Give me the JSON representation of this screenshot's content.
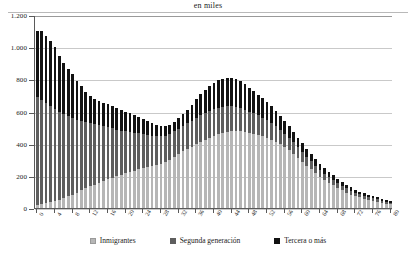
{
  "chart": {
    "title": "en miles",
    "legend": [
      {
        "key": "inmigrantes",
        "label": "Inmigrantes",
        "color": "#b6b6b6"
      },
      {
        "key": "segunda",
        "label": "Segunda generación",
        "color": "#5e5e5e"
      },
      {
        "key": "tercera",
        "label": "Tercera o más",
        "color": "#121212"
      }
    ]
  },
  "chart_data": {
    "type": "bar",
    "stacked": true,
    "title": "en miles",
    "xlabel": "",
    "ylabel": "",
    "ylim": [
      0,
      1200
    ],
    "yticks": [
      0,
      200,
      400,
      600,
      800,
      1000,
      1200
    ],
    "ytick_labels": [
      "0",
      "200",
      "400",
      "600",
      "800",
      "1.000",
      "1.200"
    ],
    "grid": true,
    "legend_position": "bottom",
    "xtick_step": 4,
    "categories": [
      "0",
      "1",
      "2",
      "3",
      "4",
      "5",
      "6",
      "7",
      "8",
      "9",
      "10",
      "11",
      "12",
      "13",
      "14",
      "15",
      "16",
      "17",
      "18",
      "19",
      "20",
      "21",
      "22",
      "23",
      "24",
      "25",
      "26",
      "27",
      "28",
      "29",
      "30",
      "31",
      "32",
      "33",
      "34",
      "35",
      "36",
      "37",
      "38",
      "39",
      "40",
      "41",
      "42",
      "43",
      "44",
      "45",
      "46",
      "47",
      "48",
      "49",
      "50",
      "51",
      "52",
      "53",
      "54",
      "55",
      "56",
      "57",
      "58",
      "59",
      "60",
      "61",
      "62",
      "63",
      "64",
      "65",
      "66",
      "67",
      "68",
      "69",
      "70",
      "71",
      "72",
      "73",
      "74",
      "75",
      "76",
      "77",
      "78",
      "79",
      "80"
    ],
    "xtick_labels": [
      "0",
      "4",
      "8",
      "12",
      "16",
      "20",
      "24",
      "28",
      "32",
      "36",
      "40",
      "44",
      "48",
      "52",
      "56",
      "60",
      "64",
      "68",
      "72",
      "76",
      "80"
    ],
    "series": [
      {
        "name": "Inmigrantes",
        "color": "#b6b6b6",
        "values": [
          18,
          24,
          30,
          36,
          44,
          52,
          62,
          72,
          84,
          96,
          110,
          122,
          134,
          146,
          158,
          168,
          178,
          188,
          196,
          206,
          216,
          224,
          232,
          240,
          248,
          256,
          262,
          268,
          276,
          286,
          300,
          318,
          336,
          352,
          366,
          380,
          396,
          410,
          424,
          436,
          448,
          458,
          466,
          472,
          478,
          480,
          478,
          474,
          468,
          462,
          456,
          448,
          438,
          426,
          412,
          396,
          378,
          358,
          336,
          312,
          288,
          264,
          240,
          216,
          194,
          174,
          156,
          140,
          124,
          110,
          96,
          84,
          74,
          66,
          58,
          52,
          46,
          40,
          34,
          28,
          24
        ]
      },
      {
        "name": "Segunda generación",
        "color": "#5e5e5e",
        "values": [
          672,
          648,
          624,
          600,
          572,
          548,
          524,
          500,
          476,
          452,
          430,
          410,
          392,
          374,
          356,
          340,
          324,
          308,
          292,
          276,
          262,
          248,
          236,
          224,
          212,
          200,
          188,
          178,
          170,
          164,
          160,
          158,
          158,
          158,
          160,
          162,
          164,
          166,
          168,
          168,
          168,
          166,
          164,
          160,
          156,
          150,
          144,
          138,
          132,
          126,
          120,
          114,
          108,
          102,
          96,
          90,
          84,
          78,
          72,
          66,
          60,
          56,
          52,
          48,
          44,
          40,
          37,
          34,
          31,
          28,
          26,
          24,
          22,
          20,
          18,
          16,
          15,
          14,
          12,
          11,
          10
        ]
      },
      {
        "name": "Tercera o más",
        "color": "#121212",
        "values": [
          410,
          428,
          416,
          404,
          386,
          348,
          316,
          290,
          272,
          244,
          218,
          190,
          168,
          158,
          150,
          146,
          144,
          140,
          136,
          130,
          122,
          116,
          110,
          104,
          96,
          88,
          80,
          72,
          66,
          62,
          58,
          60,
          66,
          74,
          86,
          100,
          116,
          130,
          144,
          156,
          164,
          170,
          174,
          176,
          176,
          172,
          166,
          158,
          148,
          138,
          128,
          120,
          112,
          104,
          96,
          88,
          80,
          72,
          66,
          60,
          54,
          50,
          46,
          42,
          38,
          35,
          32,
          29,
          26,
          24,
          22,
          20,
          18,
          16,
          15,
          14,
          13,
          12,
          11,
          10,
          9
        ]
      }
    ]
  }
}
